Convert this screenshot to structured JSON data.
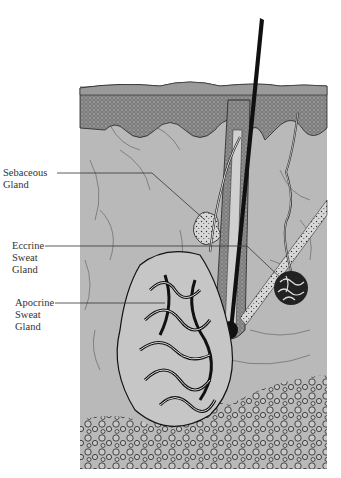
{
  "diagram": {
    "type": "anatomical-illustration",
    "colors": {
      "background": "#ffffff",
      "dermis": "#b9b9b9",
      "epidermis": "#9a9a9a",
      "ink": "#1a1a1a",
      "hair": "#111111",
      "label_text": "#333333"
    },
    "labels": [
      {
        "id": "sebaceous",
        "text": "Sebaceous\nGland"
      },
      {
        "id": "eccrine",
        "text": "Eccrine\nSweat\nGland"
      },
      {
        "id": "apocrine",
        "text": "Apocrine\nSweat\nGland"
      }
    ]
  }
}
